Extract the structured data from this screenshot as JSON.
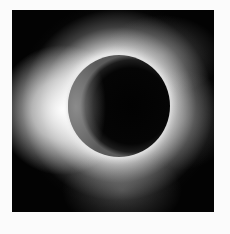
{
  "image": {
    "subject": "total solar eclipse",
    "description": "Black square photograph showing the dark lunar disc surrounded by a bright white solar corona, brightest on the left side",
    "colors": {
      "background": "#fbfbfb",
      "sky": "#030303",
      "corona": "#f5f5f5",
      "moon": "#020202"
    }
  }
}
